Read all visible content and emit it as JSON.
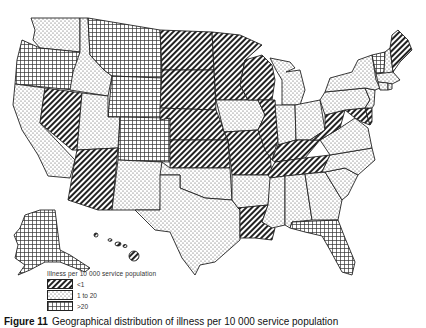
{
  "map": {
    "type": "choropleth",
    "region": "United States (incl. Alaska and Hawaii)",
    "categories": {
      "low": {
        "label": "<1",
        "pattern": "diagonal-hatch",
        "color": "#222222"
      },
      "mid": {
        "label": "1 to 20",
        "pattern": "dots",
        "color": "#444444"
      },
      "high": {
        "label": ">20",
        "pattern": "grid",
        "color": "#333333"
      }
    },
    "states": {
      "WA": "mid",
      "OR": "high",
      "CA": "mid",
      "ID": "mid",
      "NV": "low",
      "MT": "high",
      "WY": "high",
      "UT": "mid",
      "AZ": "low",
      "CO": "high",
      "NM": "mid",
      "ND": "low",
      "SD": "low",
      "NE": "low",
      "KS": "low",
      "OK": "mid",
      "TX": "mid",
      "MN": "low",
      "IA": "mid",
      "MO": "low",
      "AR": "mid",
      "LA": "low",
      "WI": "low",
      "IL": "low",
      "MI": "mid",
      "IN": "mid",
      "OH": "mid",
      "KY": "low",
      "TN": "low",
      "MS": "mid",
      "AL": "mid",
      "GA": "mid",
      "FL": "high",
      "SC": "mid",
      "NC": "mid",
      "VA": "mid",
      "WV": "low",
      "MD": "low",
      "DE": "low",
      "PA": "mid",
      "NY": "mid",
      "NJ": "mid",
      "VT": "high",
      "NH": "mid",
      "ME": "low",
      "MA": "mid",
      "CT": "mid",
      "RI": "mid",
      "AK": "high",
      "HI": "low"
    }
  },
  "legend": {
    "title": "Illness per 10 000 service population",
    "items": [
      {
        "label": "<1"
      },
      {
        "label": "1 to 20"
      },
      {
        "label": ">20"
      }
    ]
  },
  "caption": {
    "figure_label": "Figure 11",
    "text": "Geographical distribution of illness per 10 000 service population"
  }
}
